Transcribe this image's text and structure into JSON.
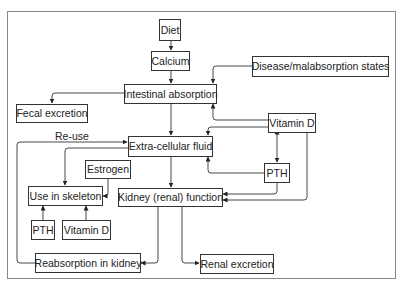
{
  "diagram": {
    "nodes": {
      "diet": "Diet",
      "calcium": "Calcium",
      "disease": "Disease/malabsorption states",
      "intestinal_absorption": "Intestinal absorption",
      "fecal_excretion": "Fecal excretion",
      "vitamin_d_right": "Vitamin D",
      "extra_cellular_fluid": "Extra-cellular fluid",
      "estrogen": "Estrogen",
      "pth_right": "PTH",
      "use_in_skeleton": "Use in skeleton",
      "kidney_function": "Kidney (renal) function",
      "pth_left": "PTH",
      "vitamin_d_left": "Vitamin D",
      "reabsorption_in_kidney": "Reabsorption in kidney",
      "renal_excretion": "Renal excretion"
    },
    "edge_labels": {
      "reuse": "Re-use"
    },
    "edges": [
      {
        "from": "Diet",
        "to": "Calcium"
      },
      {
        "from": "Calcium",
        "to": "Intestinal absorption"
      },
      {
        "from": "Disease/malabsorption states",
        "to": "Intestinal absorption"
      },
      {
        "from": "Intestinal absorption",
        "to": "Fecal excretion"
      },
      {
        "from": "Intestinal absorption",
        "to": "Extra-cellular fluid"
      },
      {
        "from": "Vitamin D",
        "to": "Intestinal absorption"
      },
      {
        "from": "Vitamin D",
        "to": "Extra-cellular fluid"
      },
      {
        "from": "Vitamin D",
        "to": "PTH",
        "bidirectional": true
      },
      {
        "from": "Vitamin D",
        "to": "Kidney (renal) function"
      },
      {
        "from": "PTH",
        "to": "Extra-cellular fluid"
      },
      {
        "from": "PTH",
        "to": "Kidney (renal) function"
      },
      {
        "from": "Extra-cellular fluid",
        "to": "Use in skeleton"
      },
      {
        "from": "Extra-cellular fluid",
        "to": "Kidney (renal) function"
      },
      {
        "from": "Estrogen",
        "to": "Use in skeleton"
      },
      {
        "from": "PTH",
        "to": "Use in skeleton"
      },
      {
        "from": "Vitamin D",
        "to": "Use in skeleton"
      },
      {
        "from": "Kidney (renal) function",
        "to": "Reabsorption in kidney"
      },
      {
        "from": "Kidney (renal) function",
        "to": "Renal excretion"
      },
      {
        "from": "Reabsorption in kidney",
        "to": "Extra-cellular fluid",
        "label": "Re-use"
      }
    ]
  }
}
